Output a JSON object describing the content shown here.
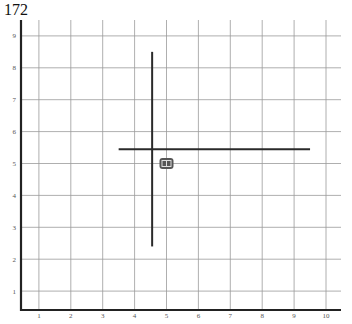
{
  "title": "172",
  "chart_data": {
    "type": "scatter",
    "title": "172",
    "xlabel": "",
    "ylabel": "",
    "xlim": [
      0.5,
      10.5
    ],
    "ylim": [
      0.6,
      9.5
    ],
    "grid": true,
    "x_ticks": [
      "1",
      "2",
      "3",
      "4",
      "5",
      "6",
      "7",
      "8",
      "9",
      "10"
    ],
    "y_ticks": [
      "1",
      "2",
      "3",
      "4",
      "5",
      "6",
      "7",
      "8",
      "9"
    ],
    "points": [
      {
        "x": 5.0,
        "y": 5.0,
        "marker": "robot-icon"
      }
    ],
    "segments": [
      {
        "name": "vertical-line",
        "x1": 4.55,
        "y1": 2.4,
        "x2": 4.55,
        "y2": 8.5
      },
      {
        "name": "horizontal-line",
        "x1": 3.5,
        "y1": 5.45,
        "x2": 9.5,
        "y2": 5.45
      }
    ]
  },
  "colors": {
    "grid": "#9a9a9a",
    "axis": "#222222",
    "line": "#2a2a2a",
    "marker": "#555555"
  }
}
